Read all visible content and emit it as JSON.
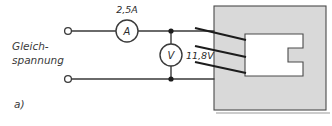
{
  "figure": {
    "subfigure_label": "a)",
    "supply_label_line1": "Gleich-",
    "supply_label_line2": "spannung"
  },
  "meters": {
    "ammeter": {
      "glyph": "A",
      "reading": "2,5A"
    },
    "voltmeter": {
      "glyph": "V",
      "reading": "11,8V"
    }
  },
  "icons": {
    "ammeter_icon": "ammeter-circle-icon",
    "voltmeter_icon": "voltmeter-circle-icon",
    "terminal_icon": "open-terminal-circle-icon",
    "junction_icon": "wire-junction-dot-icon"
  },
  "colors": {
    "wire": "#3a3a3a",
    "lead_wire": "#1c1c1c",
    "block_fill": "#d9d9d9",
    "block_stroke": "#4a4a4a",
    "cutout_fill": "#ffffff",
    "text": "#2b2b2b",
    "background": "#ffffff"
  }
}
